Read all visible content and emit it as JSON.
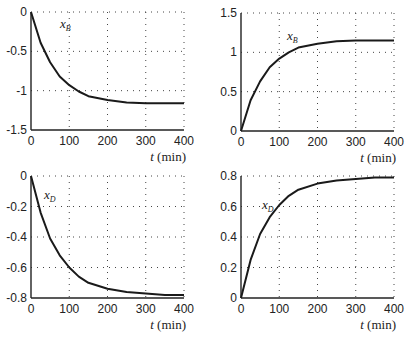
{
  "chart_data": [
    {
      "type": "line",
      "panel": "top-left",
      "title": "",
      "series": [
        {
          "name": "x_B",
          "label": "x",
          "subscript": "B",
          "x": [
            0,
            25,
            50,
            75,
            100,
            125,
            150,
            200,
            250,
            300,
            350,
            400
          ],
          "values": [
            0,
            -0.39,
            -0.64,
            -0.82,
            -0.93,
            -1.01,
            -1.07,
            -1.12,
            -1.15,
            -1.16,
            -1.16,
            -1.16
          ]
        }
      ],
      "xlabel": "t (min)",
      "ylabel": "",
      "xlim": [
        0,
        400
      ],
      "ylim": [
        -1.5,
        0
      ],
      "xticks": [
        "0",
        "100",
        "200",
        "300",
        "400"
      ],
      "yticks": [
        "0",
        "-0.5",
        "-1",
        "-1.5"
      ],
      "grid": true
    },
    {
      "type": "line",
      "panel": "top-right",
      "title": "",
      "series": [
        {
          "name": "x_B",
          "label": "x",
          "subscript": "B",
          "x": [
            0,
            25,
            50,
            75,
            100,
            125,
            150,
            200,
            250,
            300,
            350,
            400
          ],
          "values": [
            0,
            0.39,
            0.63,
            0.81,
            0.92,
            1.0,
            1.06,
            1.11,
            1.14,
            1.15,
            1.15,
            1.15
          ]
        }
      ],
      "xlabel": "t (min)",
      "ylabel": "",
      "xlim": [
        0,
        400
      ],
      "ylim": [
        0,
        1.5
      ],
      "xticks": [
        "0",
        "100",
        "200",
        "300",
        "400"
      ],
      "yticks": [
        "0",
        "0.5",
        "1",
        "1.5"
      ],
      "grid": true
    },
    {
      "type": "line",
      "panel": "bottom-left",
      "title": "",
      "series": [
        {
          "name": "x_D",
          "label": "x",
          "subscript": "D",
          "x": [
            0,
            25,
            50,
            75,
            100,
            125,
            150,
            200,
            250,
            300,
            350,
            400
          ],
          "values": [
            0,
            -0.24,
            -0.41,
            -0.52,
            -0.6,
            -0.66,
            -0.7,
            -0.74,
            -0.76,
            -0.77,
            -0.78,
            -0.78
          ]
        }
      ],
      "xlabel": "t (min)",
      "ylabel": "",
      "xlim": [
        0,
        400
      ],
      "ylim": [
        -0.8,
        0
      ],
      "xticks": [
        "0",
        "100",
        "200",
        "300",
        "400"
      ],
      "yticks": [
        "0",
        "-0.2",
        "-0.4",
        "-0.6",
        "-0.8"
      ],
      "grid": true
    },
    {
      "type": "line",
      "panel": "bottom-right",
      "title": "",
      "series": [
        {
          "name": "x_D",
          "label": "x",
          "subscript": "D",
          "x": [
            0,
            25,
            50,
            75,
            100,
            125,
            150,
            200,
            250,
            300,
            350,
            400
          ],
          "values": [
            0,
            0.25,
            0.42,
            0.53,
            0.61,
            0.67,
            0.71,
            0.75,
            0.77,
            0.78,
            0.79,
            0.79
          ]
        }
      ],
      "xlabel": "t (min)",
      "ylabel": "",
      "xlim": [
        0,
        400
      ],
      "ylim": [
        0,
        0.8
      ],
      "xticks": [
        "0",
        "100",
        "200",
        "300",
        "400"
      ],
      "yticks": [
        "0",
        "0.2",
        "0.4",
        "0.6",
        "0.8"
      ],
      "grid": true
    }
  ],
  "labels": {
    "xaxis": "t (min)",
    "xaxis_var": "t",
    "xaxis_unit": "(min)",
    "xB": "x",
    "xB_sub": "B",
    "xD": "x",
    "xD_sub": "D"
  }
}
